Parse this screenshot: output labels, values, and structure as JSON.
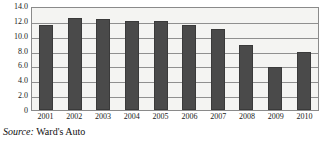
{
  "chart_data": {
    "type": "bar",
    "title": "",
    "xlabel": "",
    "ylabel": "",
    "categories": [
      "2001",
      "2002",
      "2003",
      "2004",
      "2005",
      "2006",
      "2007",
      "2008",
      "2009",
      "2010"
    ],
    "values": [
      11.5,
      12.4,
      12.2,
      12.0,
      12.0,
      11.4,
      10.9,
      8.7,
      5.8,
      7.8
    ],
    "ylim": [
      0,
      14
    ],
    "ytick_labels": [
      "14.0",
      "12.0",
      "10.0",
      "8.0",
      "6.0",
      "4.0",
      "2.0",
      "0"
    ],
    "ytick_values": [
      14,
      12,
      10,
      8,
      6,
      4,
      2,
      0
    ],
    "grid": true,
    "legend": false,
    "bar_color": "#4a4a4a",
    "plot_background": "#f4f4f2",
    "gridline_color": "#8f8f8f",
    "frame_color": "#8a8a8a"
  },
  "source": {
    "label": "Source:",
    "text": "Ward's Auto"
  }
}
